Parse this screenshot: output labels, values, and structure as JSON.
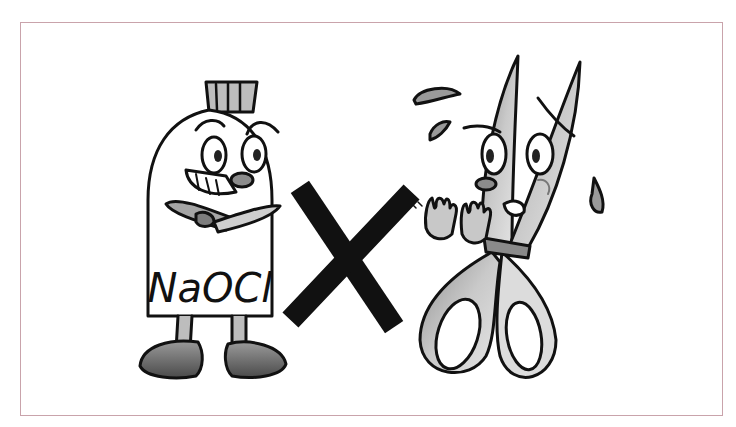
{
  "illustration": {
    "bottle_label": "NaOCl",
    "separator_symbol": "X",
    "description": "Cartoon of a grinning bleach bottle labeled NaOCl and a frightened, sweating pair of scissors, separated by a large X"
  },
  "colors": {
    "frame_border": "#c9a3ab",
    "ink": "#111111",
    "shade_dark": "#6e6e6e",
    "shade_mid": "#a8a8a8",
    "shade_light": "#d9d9d9",
    "background": "#ffffff"
  }
}
